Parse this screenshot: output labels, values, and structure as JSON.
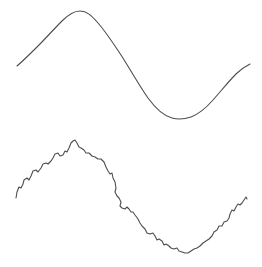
{
  "figure": {
    "background_color": "#ffffff",
    "width": 262,
    "height": 267
  },
  "chart_data": {
    "type": "line",
    "title": "",
    "subtitle": "",
    "xlabel": "",
    "ylabel": "",
    "grid": false,
    "legend": null,
    "axes_visible": false,
    "tick_labels": [],
    "annotations": [],
    "xlim": [
      0,
      262
    ],
    "ylim": [
      0,
      267
    ],
    "series": [
      {
        "name": "smooth-sine",
        "style": "smooth",
        "color": "#4d4d4d",
        "line_width": 1.1,
        "amplitude": 54,
        "baseline_y": 65,
        "x_start": 17,
        "x_end": 250,
        "peak": {
          "x": 80,
          "y": 11
        },
        "trough": {
          "x": 188,
          "y": 118
        },
        "path": "M 17,66 C 24,60 31,53 38,46 C 46,38 54,29 62,21 C 68,15 73,11 80,11 C 87,11 92,16 98,23 C 106,32 113,43 121,55 C 130,69 139,85 148,98 C 156,109 164,116 172,118 C 179,120 185,119 191,117 C 199,114 206,108 213,100 C 221,91 229,81 236,74 C 241,69 246,66 250,64"
      },
      {
        "name": "noisy-sine",
        "style": "jagged",
        "color": "#4d4d4d",
        "line_width": 1.1,
        "amplitude": 54,
        "baseline_y": 198,
        "x_start": 16,
        "x_end": 247,
        "peak": {
          "x": 76,
          "y": 141
        },
        "trough": {
          "x": 188,
          "y": 253
        },
        "noise_level": 4,
        "path": "M 16,198 L 17,192 L 19,187 L 21,188 L 23,184 L 24,180 L 27,178 L 29,180 L 31,176 L 33,171 L 36,170 L 38,172 L 41,168 L 43,164 L 46,163 L 48,164 L 51,161 L 53,158 L 55,154 L 58,153 L 60,156 L 63,155 L 65,151 L 67,152 L 69,148 L 71,143 L 73,141 L 75,140 L 77,143 L 79,147 L 81,148 L 84,150 L 86,153 L 89,153 L 92,156 L 95,157 L 98,159 L 101,159 L 104,162 L 106,167 L 108,171 L 110,174 L 112,173 L 113,178 L 115,182 L 116,188 L 115,192 L 117,196 L 119,198 L 121,202 L 120,206 L 122,208 L 125,209 L 127,207 L 129,209 L 131,212 L 133,212 L 135,215 L 138,219 L 140,223 L 142,226 L 145,229 L 147,233 L 150,234 L 153,233 L 155,236 L 157,240 L 159,239 L 162,241 L 164,245 L 166,244 L 169,246 L 171,248 L 174,249 L 177,248 L 179,251 L 182,252 L 185,253 L 188,253 L 191,251 L 194,249 L 197,248 L 200,246 L 203,243 L 206,241 L 209,239 L 212,236 L 214,232 L 217,230 L 219,226 L 222,226 L 224,222 L 227,221 L 229,218 L 230,214 L 232,210 L 234,211 L 236,207 L 238,204 L 240,205 L 242,203 L 244,200 L 246,197 L 247,199"
      }
    ]
  }
}
